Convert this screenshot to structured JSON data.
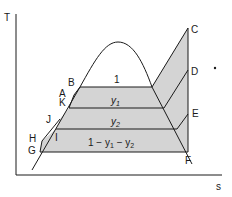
{
  "diagram": {
    "type": "T-s diagram (regenerative Rankine cycle with feedwater heating)",
    "axes": {
      "ylabel": "T",
      "xlabel": "s"
    },
    "points": {
      "A": "A",
      "B": "B",
      "C": "C",
      "D": "D",
      "E": "E",
      "F": "F",
      "G": "G",
      "H": "H",
      "I": "I",
      "J": "J",
      "K": "K"
    },
    "region_labels": {
      "top": "1",
      "y1": "y",
      "y1_sub": "1",
      "y2": "y",
      "y2_sub": "2",
      "bottom_prefix": "1 − y",
      "bottom_sub1": "1",
      "bottom_mid": " − y",
      "bottom_sub2": "2"
    },
    "colors": {
      "fill": "#d4d4d4",
      "line": "#1a1a1a",
      "background": "#ffffff"
    }
  }
}
